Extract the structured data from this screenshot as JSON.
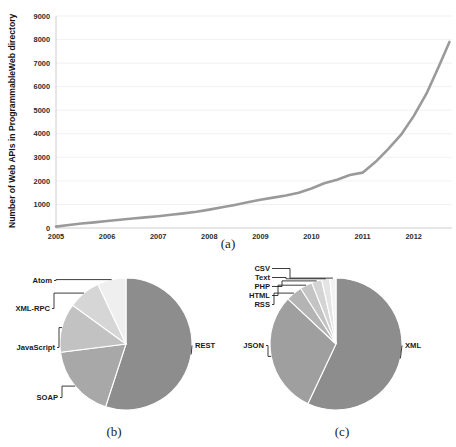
{
  "figure": {
    "captions": {
      "a": "(a)",
      "b": "(b)",
      "c": "(c)"
    }
  },
  "chart_data": [
    {
      "id": "panel-a",
      "type": "line",
      "title": "",
      "xlabel": "",
      "ylabel": "Number of Web APIs in ProgrammableWeb directory",
      "xlim": [
        2005,
        2012.75
      ],
      "ylim": [
        0,
        9000
      ],
      "grid": true,
      "legend": "none",
      "line_color": "#9a9a9a",
      "xticks": [
        "2005",
        "2006",
        "2007",
        "2008",
        "2009",
        "2010",
        "2011",
        "2012"
      ],
      "yticks": [
        "0",
        "1000",
        "2000",
        "3000",
        "4000",
        "5000",
        "6000",
        "7000",
        "8000",
        "9000"
      ],
      "x": [
        2005.0,
        2005.25,
        2005.5,
        2005.75,
        2006.0,
        2006.25,
        2006.5,
        2006.75,
        2007.0,
        2007.25,
        2007.5,
        2007.75,
        2008.0,
        2008.25,
        2008.5,
        2008.75,
        2009.0,
        2009.25,
        2009.5,
        2009.75,
        2010.0,
        2010.25,
        2010.5,
        2010.75,
        2011.0,
        2011.25,
        2011.5,
        2011.75,
        2012.0,
        2012.25,
        2012.5,
        2012.7
      ],
      "values": [
        60,
        130,
        190,
        240,
        300,
        350,
        400,
        450,
        500,
        560,
        620,
        690,
        780,
        880,
        980,
        1090,
        1200,
        1290,
        1380,
        1500,
        1680,
        1900,
        2050,
        2250,
        2350,
        2800,
        3350,
        3950,
        4750,
        5700,
        6900,
        7900
      ]
    },
    {
      "id": "panel-b",
      "type": "pie",
      "title": "",
      "legend": "leader-lines",
      "categories": [
        "REST",
        "SOAP",
        "JavaScript",
        "XML-RPC",
        "Atom"
      ],
      "values": [
        55,
        18,
        12,
        8,
        7
      ],
      "colors": [
        "#8d8d8d",
        "#a8a8a8",
        "#c2c2c2",
        "#d6d6d6",
        "#efefef"
      ]
    },
    {
      "id": "panel-c",
      "type": "pie",
      "title": "",
      "legend": "leader-lines",
      "categories": [
        "XML",
        "JSON",
        "RSS",
        "HTML",
        "PHP",
        "Text",
        "CSV"
      ],
      "values": [
        57,
        30,
        4,
        3,
        2.5,
        2,
        1.5
      ],
      "colors": [
        "#8d8d8d",
        "#9f9f9f",
        "#b4b4b4",
        "#c4c4c4",
        "#d4d4d4",
        "#e4e4e4",
        "#f2f2f2"
      ]
    }
  ]
}
